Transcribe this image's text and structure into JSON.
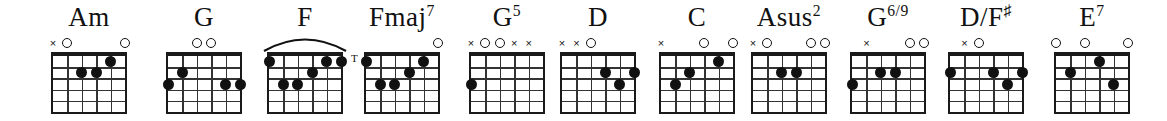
{
  "sheet": {
    "title": "Guitar chord diagram row",
    "width": 1167,
    "height": 121,
    "background": "#ffffff",
    "ink": "#111111",
    "strings": 6,
    "frets": 5,
    "string_order_note": "index 0 = lowest string (6th/E), index 5 = highest string (1st/e)"
  },
  "chords": [
    {
      "id": "am",
      "name": "Am",
      "name_base": "Am",
      "name_sup": "",
      "left": 30,
      "width": 118,
      "markers": [
        "x",
        "o",
        "",
        "",
        "",
        "o"
      ],
      "dots": [
        {
          "string": 2,
          "fret": 2
        },
        {
          "string": 3,
          "fret": 2
        },
        {
          "string": 4,
          "fret": 1
        }
      ],
      "barre": null,
      "thumb": false
    },
    {
      "id": "g",
      "name": "G",
      "name_base": "G",
      "name_sup": "",
      "left": 148,
      "width": 112,
      "markers": [
        "",
        "",
        "o",
        "o",
        "",
        ""
      ],
      "dots": [
        {
          "string": 0,
          "fret": 3
        },
        {
          "string": 1,
          "fret": 2
        },
        {
          "string": 4,
          "fret": 3
        },
        {
          "string": 5,
          "fret": 3
        }
      ],
      "barre": null,
      "thumb": false
    },
    {
      "id": "f",
      "name": "F",
      "name_base": "F",
      "name_sup": "",
      "left": 255,
      "width": 100,
      "markers": [
        "",
        "",
        "",
        "",
        "",
        ""
      ],
      "dots": [
        {
          "string": 0,
          "fret": 1
        },
        {
          "string": 4,
          "fret": 1
        },
        {
          "string": 5,
          "fret": 1
        },
        {
          "string": 3,
          "fret": 2
        },
        {
          "string": 1,
          "fret": 3
        },
        {
          "string": 2,
          "fret": 3
        }
      ],
      "barre": {
        "fret": 1,
        "from": 0,
        "to": 5
      },
      "thumb": false
    },
    {
      "id": "fmaj7",
      "name": "Fmaj7",
      "name_base": "Fmaj",
      "name_sup": "7",
      "left": 348,
      "width": 108,
      "markers": [
        "",
        "",
        "",
        "",
        "",
        "o"
      ],
      "dots": [
        {
          "string": 0,
          "fret": 1
        },
        {
          "string": 4,
          "fret": 1
        },
        {
          "string": 3,
          "fret": 2
        },
        {
          "string": 1,
          "fret": 3
        },
        {
          "string": 2,
          "fret": 3
        }
      ],
      "barre": null,
      "thumb": true,
      "thumb_label": "T"
    },
    {
      "id": "g5",
      "name": "G5",
      "name_base": "G",
      "name_sup": "5",
      "left": 455,
      "width": 104,
      "markers": [
        "x",
        "o",
        "o",
        "x",
        "x",
        ""
      ],
      "dots": [
        {
          "string": 0,
          "fret": 3
        }
      ],
      "barre": null,
      "thumb": false
    },
    {
      "id": "d",
      "name": "D",
      "name_base": "D",
      "name_sup": "",
      "left": 546,
      "width": 104,
      "markers": [
        "x",
        "x",
        "o",
        "",
        "",
        ""
      ],
      "dots": [
        {
          "string": 3,
          "fret": 2
        },
        {
          "string": 5,
          "fret": 2
        },
        {
          "string": 4,
          "fret": 3
        }
      ],
      "barre": null,
      "thumb": false
    },
    {
      "id": "c",
      "name": "C",
      "name_base": "C",
      "name_sup": "",
      "left": 643,
      "width": 108,
      "markers": [
        "x",
        "",
        "",
        "o",
        "",
        "o"
      ],
      "dots": [
        {
          "string": 4,
          "fret": 1
        },
        {
          "string": 2,
          "fret": 2
        },
        {
          "string": 1,
          "fret": 3
        }
      ],
      "barre": null,
      "thumb": false
    },
    {
      "id": "asus2",
      "name": "Asus2",
      "name_base": "Asus",
      "name_sup": "2",
      "left": 735,
      "width": 108,
      "markers": [
        "x",
        "o",
        "",
        "",
        "o",
        "o"
      ],
      "dots": [
        {
          "string": 2,
          "fret": 2
        },
        {
          "string": 3,
          "fret": 2
        }
      ],
      "barre": null,
      "thumb": false
    },
    {
      "id": "g69",
      "name": "G6/9",
      "name_base": "G",
      "name_sup": "6/9",
      "left": 833,
      "width": 110,
      "markers": [
        "",
        "x",
        "",
        "",
        "o",
        "o"
      ],
      "dots": [
        {
          "string": 0,
          "fret": 3
        },
        {
          "string": 2,
          "fret": 2
        },
        {
          "string": 3,
          "fret": 2
        }
      ],
      "barre": null,
      "thumb": false
    },
    {
      "id": "dslashfsharp",
      "name": "D/F#",
      "name_base": "D/F",
      "name_sup": "♯",
      "left": 932,
      "width": 108,
      "markers": [
        "",
        "x",
        "o",
        "",
        "",
        ""
      ],
      "dots": [
        {
          "string": 0,
          "fret": 2
        },
        {
          "string": 3,
          "fret": 2
        },
        {
          "string": 5,
          "fret": 2
        },
        {
          "string": 4,
          "fret": 3
        }
      ],
      "barre": null,
      "thumb": false
    },
    {
      "id": "e7",
      "name": "E7",
      "name_base": "E",
      "name_sup": "7",
      "left": 1038,
      "width": 108,
      "markers": [
        "o",
        "",
        "o",
        "",
        "",
        "o"
      ],
      "dots": [
        {
          "string": 3,
          "fret": 1
        },
        {
          "string": 1,
          "fret": 2
        },
        {
          "string": 4,
          "fret": 3
        }
      ],
      "barre": null,
      "thumb": false
    }
  ]
}
